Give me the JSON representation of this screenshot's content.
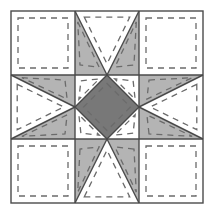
{
  "diagram": {
    "type": "quilt-block-piecing-diagram",
    "grid": {
      "rows": 3,
      "cols": 3
    },
    "canvas": {
      "width": 215,
      "height": 216
    },
    "block": {
      "x": 11,
      "y": 11,
      "size": 192,
      "cell": 64
    },
    "colors": {
      "background": "#ffffff",
      "fabric_light": "#ffffff",
      "fabric_medium": "#b4b4b4",
      "fabric_dark": "#787878",
      "outline": "#4a4a4a",
      "seam_dash": "#6b6b6b"
    },
    "strokes": {
      "outline_width": 1.4,
      "seam_dash_width": 1.3,
      "seam_dash_pattern": "6 5",
      "seam_inset": 7
    },
    "units": [
      {
        "name": "corner-top-left",
        "row": 0,
        "col": 0,
        "unit": "plain-square",
        "fabric": "light"
      },
      {
        "name": "edge-top-center",
        "row": 0,
        "col": 1,
        "unit": "quarter-square-triangle",
        "point": "down",
        "point_fabric": "light",
        "side_fabric": "medium"
      },
      {
        "name": "corner-top-right",
        "row": 0,
        "col": 2,
        "unit": "plain-square",
        "fabric": "light"
      },
      {
        "name": "edge-middle-left",
        "row": 1,
        "col": 0,
        "unit": "quarter-square-triangle",
        "point": "right",
        "point_fabric": "light",
        "side_fabric": "medium"
      },
      {
        "name": "center-square",
        "row": 1,
        "col": 1,
        "unit": "square-on-point",
        "fabric": "dark",
        "corner_fabric": "light"
      },
      {
        "name": "edge-middle-right",
        "row": 1,
        "col": 2,
        "unit": "quarter-square-triangle",
        "point": "left",
        "point_fabric": "light",
        "side_fabric": "medium"
      },
      {
        "name": "corner-bottom-left",
        "row": 2,
        "col": 0,
        "unit": "plain-square",
        "fabric": "light"
      },
      {
        "name": "edge-bottom-center",
        "row": 2,
        "col": 1,
        "unit": "quarter-square-triangle",
        "point": "up",
        "point_fabric": "light",
        "side_fabric": "medium"
      },
      {
        "name": "corner-bottom-right",
        "row": 2,
        "col": 2,
        "unit": "plain-square",
        "fabric": "light"
      }
    ]
  }
}
